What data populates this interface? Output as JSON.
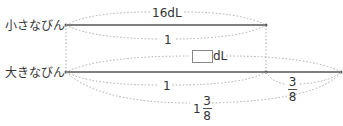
{
  "diagram": {
    "rows": [
      {
        "label": "小さなびん",
        "total": "16dL",
        "ratio": "1"
      },
      {
        "label": "大きなびん",
        "base": "1",
        "extra": {
          "numerator": "3",
          "denominator": "8"
        },
        "total": {
          "whole": "1",
          "numerator": "3",
          "denominator": "8"
        }
      }
    ],
    "unknown_unit": "dL",
    "colors": {
      "line": "#555555",
      "dotted": "#aaaaaa",
      "text": "#333333"
    }
  }
}
